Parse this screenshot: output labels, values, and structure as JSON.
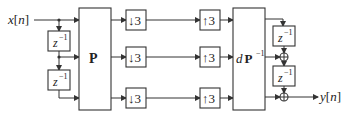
{
  "input": {
    "label_var": "x",
    "label_idx": "n"
  },
  "output": {
    "label_var": "y",
    "label_idx": "n"
  },
  "delay": {
    "base": "z",
    "exp": "−1"
  },
  "analysis_matrix": {
    "label": "P"
  },
  "synthesis_matrix": {
    "scale": "d",
    "label": "P",
    "exp": "−1"
  },
  "downsample": {
    "arrow": "↓",
    "factor": "3"
  },
  "upsample": {
    "arrow": "↑",
    "factor": "3"
  },
  "channels": 3
}
